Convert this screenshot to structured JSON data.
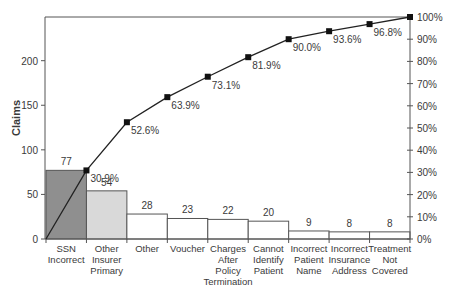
{
  "chart_data": {
    "type": "bar",
    "subtype": "pareto",
    "title": "",
    "xlabel": "",
    "ylabel": "Claims",
    "y2label": "",
    "categories": [
      [
        "SSN",
        "Incorrect"
      ],
      [
        "Other",
        "Insurer",
        "Primary"
      ],
      [
        "Other"
      ],
      [
        "Voucher"
      ],
      [
        "Charges",
        "After",
        "Policy",
        "Termination"
      ],
      [
        "Cannot",
        "Identify",
        "Patient"
      ],
      [
        "Incorrect",
        "Patient",
        "Name"
      ],
      [
        "Incorrect",
        "Insurance",
        "Address"
      ],
      [
        "Treatment",
        "Not",
        "Covered"
      ]
    ],
    "category_names": [
      "SSN Incorrect",
      "Other Insurer Primary",
      "Other",
      "Voucher",
      "Charges After Policy Termination",
      "Cannot Identify Patient",
      "Incorrect Patient Name",
      "Incorrect Insurance Address",
      "Treatment Not Covered"
    ],
    "series": [
      {
        "name": "Claims",
        "type": "bar",
        "values": [
          77,
          54,
          28,
          23,
          22,
          20,
          9,
          8,
          8
        ]
      },
      {
        "name": "Cumulative %",
        "type": "line",
        "axis": "right",
        "values": [
          30.9,
          52.6,
          63.9,
          73.1,
          81.9,
          90.0,
          93.6,
          96.8,
          100
        ]
      }
    ],
    "bar_labels": [
      "77",
      "54",
      "28",
      "23",
      "22",
      "20",
      "9",
      "8",
      "8"
    ],
    "line_labels": [
      "30.9%",
      "52.6%",
      "63.9%",
      "73.1%",
      "81.9%",
      "90.0%",
      "93.6%",
      "96.8%",
      "100%"
    ],
    "bar_colors": [
      "#8f8f8f",
      "#d9d9d9",
      "#ffffff",
      "#ffffff",
      "#ffffff",
      "#ffffff",
      "#ffffff",
      "#ffffff",
      "#ffffff"
    ],
    "ylim": [
      0,
      249
    ],
    "y_ticks": [
      "0",
      "50",
      "100",
      "150",
      "200"
    ],
    "y_tick_values": [
      0,
      50,
      100,
      150,
      200
    ],
    "y2lim": [
      0,
      100
    ],
    "y2_ticks": [
      "0%",
      "10%",
      "20%",
      "30%",
      "40%",
      "50%",
      "60%",
      "70%",
      "80%",
      "90%",
      "100%"
    ],
    "grid": false,
    "legend": "none"
  }
}
